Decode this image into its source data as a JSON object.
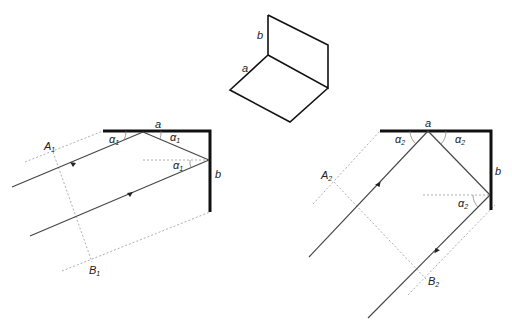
{
  "top_figure": {
    "labels": {
      "a": "a",
      "b": "b"
    }
  },
  "left_figure": {
    "labels": {
      "a": "a",
      "b": "b",
      "A": "A",
      "A_sub": "1",
      "B": "B",
      "B_sub": "1",
      "alpha": "α",
      "alpha_sub": "1"
    }
  },
  "right_figure": {
    "labels": {
      "a": "a",
      "b": "b",
      "A": "A",
      "A_sub": "2",
      "B": "B",
      "B_sub": "2",
      "alpha": "α",
      "alpha_sub": "2"
    }
  },
  "colors": {
    "mirror": "#111111",
    "ray": "#444444",
    "guide": "#999999"
  }
}
